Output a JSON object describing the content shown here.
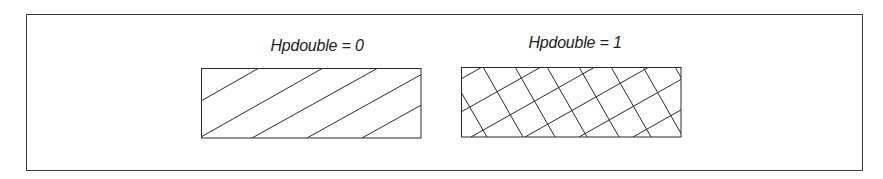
{
  "figure": {
    "panels": [
      {
        "label": "Hpdouble = 0",
        "pattern": "single-hatch",
        "hatch_angle_deg": 30,
        "hatch_direction": "diagonal-up-right"
      },
      {
        "label": "Hpdouble = 1",
        "pattern": "cross-hatch",
        "hatch_angle_deg": [
          30,
          120
        ],
        "hatch_direction": "crossed"
      }
    ],
    "colors": {
      "stroke": "#2a2a2a",
      "background": "#ffffff"
    }
  }
}
